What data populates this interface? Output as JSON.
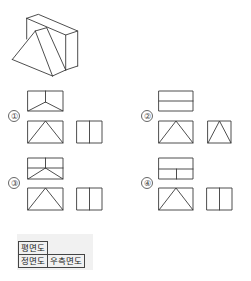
{
  "figure": {
    "type": "orthographic-projection-question",
    "isometric_view": "wedge-shaped block (rectangular box with triangular prism attached on front)"
  },
  "options": [
    {
      "label": "①",
      "top_view": "rectangle with vertical line from top center to middle, two diagonals to bottom corners",
      "front_view": "rectangle with triangle (apex top center)",
      "side_view": "rectangle with center vertical line"
    },
    {
      "label": "②",
      "top_view": "rectangle with horizontal middle line",
      "front_view": "rectangle with triangle (apex top center)",
      "side_view": "rectangle with triangle (apex top center)"
    },
    {
      "label": "③",
      "top_view": "rectangle with vertical top half line, horizontal middle line, two diagonals to bottom corners",
      "front_view": "rectangle with triangle (apex top center)",
      "side_view": "rectangle with center vertical line"
    },
    {
      "label": "④",
      "top_view": "rectangle with horizontal middle line and vertical line in lower half",
      "front_view": "rectangle with triangle (apex top center)",
      "side_view": "rectangle with center vertical line"
    }
  ],
  "legend": {
    "plan_view": "평면도",
    "front_view": "정면도",
    "right_side_view": "우측면도"
  },
  "colors": {
    "line": "#3a3a3a",
    "legend_bg": "#f1f1f1"
  }
}
